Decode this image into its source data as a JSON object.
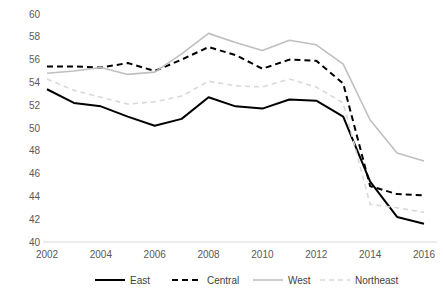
{
  "chart_data": {
    "type": "line",
    "title": "",
    "xlabel": "",
    "ylabel": "",
    "x": [
      2002,
      2003,
      2004,
      2005,
      2006,
      2007,
      2008,
      2009,
      2010,
      2011,
      2012,
      2013,
      2014,
      2015,
      2016
    ],
    "xlim": [
      2002,
      2016
    ],
    "ylim": [
      40,
      60
    ],
    "x_tick_labels": [
      "2002",
      "2004",
      "2006",
      "2008",
      "2010",
      "2012",
      "2014",
      "2016"
    ],
    "x_ticks": [
      2002,
      2004,
      2006,
      2008,
      2010,
      2012,
      2014,
      2016
    ],
    "y_tick_labels": [
      "40",
      "42",
      "44",
      "46",
      "48",
      "50",
      "52",
      "54",
      "56",
      "58",
      "60"
    ],
    "y_ticks": [
      40,
      42,
      44,
      46,
      48,
      50,
      52,
      54,
      56,
      58,
      60
    ],
    "grid": false,
    "legend_position": "bottom",
    "series": [
      {
        "name": "East",
        "color": "#000000",
        "dash": "none",
        "width": 2.0,
        "values": [
          53.4,
          52.2,
          51.9,
          51.0,
          50.2,
          50.8,
          52.7,
          51.9,
          51.7,
          52.5,
          52.4,
          51.0,
          45.3,
          42.2,
          41.6
        ]
      },
      {
        "name": "Central",
        "color": "#000000",
        "dash": "6,4",
        "width": 2.0,
        "values": [
          55.4,
          55.4,
          55.3,
          55.7,
          55.0,
          56.0,
          57.1,
          56.4,
          55.2,
          56.0,
          55.9,
          53.9,
          44.9,
          44.2,
          44.1
        ]
      },
      {
        "name": "West",
        "color": "#bfbfbf",
        "dash": "none",
        "width": 1.6,
        "values": [
          54.8,
          55.0,
          55.3,
          54.7,
          54.9,
          56.5,
          58.3,
          57.5,
          56.8,
          57.7,
          57.3,
          55.6,
          50.7,
          47.8,
          47.1
        ]
      },
      {
        "name": "Northeast",
        "color": "#d9d9d9",
        "dash": "5,4",
        "width": 1.6,
        "values": [
          54.3,
          53.3,
          52.7,
          52.1,
          52.3,
          52.8,
          54.1,
          53.7,
          53.6,
          54.3,
          53.6,
          52.2,
          43.3,
          43.0,
          42.6
        ]
      }
    ]
  },
  "legend": {
    "items": [
      {
        "label": "East"
      },
      {
        "label": "Central"
      },
      {
        "label": "West"
      },
      {
        "label": "Northeast"
      }
    ]
  },
  "colors": {
    "axis": "#d9d9d9",
    "tick_text": "#595959",
    "legend_text": "#404040",
    "background": "#ffffff"
  }
}
